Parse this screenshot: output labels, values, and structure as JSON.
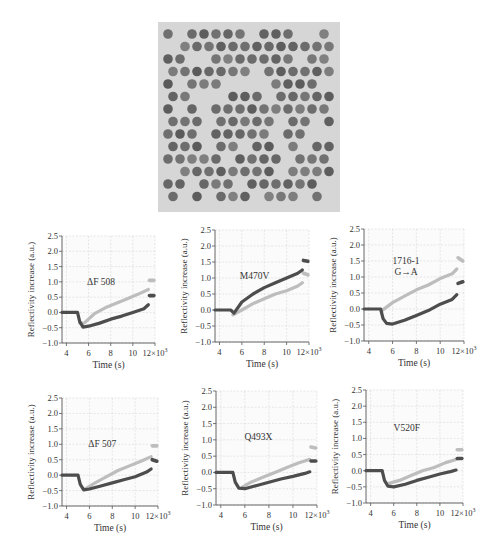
{
  "figure": {
    "image_panel": {
      "description": "microarray photograph with spotted DNA probes",
      "rows": 14,
      "cols": 14
    }
  },
  "chart_data": [
    {
      "type": "line",
      "title": "ΔF 508",
      "title_lines": [
        "ΔF 508"
      ],
      "xlabel": "Time (s)",
      "ylabel": "Reflectivity increase (a.u.)",
      "x_scale_note": "×10³",
      "xticks": [
        "4",
        "6",
        "8",
        "10",
        "12×10³"
      ],
      "yticks": [
        "2.5",
        "2.0",
        "1.5",
        "1.0",
        "0.5",
        "0.0",
        "−0.5",
        "−1.0"
      ],
      "xlim": [
        3.6,
        12.0
      ],
      "ylim": [
        -1.0,
        2.5
      ],
      "grid": true,
      "series": [
        {
          "name": "light trace",
          "color": "#bdbdbd",
          "x": [
            5.2,
            5.6,
            6.5,
            7.5,
            8.5,
            9.5,
            10.5,
            11.4,
            11.5,
            11.9
          ],
          "y": [
            -0.35,
            -0.35,
            -0.05,
            0.15,
            0.3,
            0.45,
            0.6,
            0.75,
            1.05,
            1.05
          ]
        },
        {
          "name": "dark trace",
          "color": "#4d4d4d",
          "x": [
            3.6,
            5.0,
            5.2,
            5.5,
            6.0,
            7.0,
            8.0,
            9.0,
            10.0,
            11.0,
            11.4,
            11.5,
            11.9
          ],
          "y": [
            0.0,
            0.0,
            -0.3,
            -0.48,
            -0.45,
            -0.35,
            -0.22,
            -0.12,
            0.0,
            0.12,
            0.25,
            0.55,
            0.55
          ]
        }
      ]
    },
    {
      "type": "line",
      "title": "M470V",
      "title_lines": [
        "M470V"
      ],
      "xlabel": "Time (s)",
      "ylabel": "Reflectivity increase (a.u.)",
      "xticks": [
        "4",
        "6",
        "8",
        "10",
        "12×10³"
      ],
      "yticks": [
        "2.5",
        "2.0",
        "1.5",
        "1.0",
        "0.5",
        "0.0",
        "−0.5",
        "−1.0"
      ],
      "xlim": [
        3.6,
        12.0
      ],
      "ylim": [
        -1.0,
        2.5
      ],
      "grid": true,
      "series": [
        {
          "name": "light trace",
          "color": "#bdbdbd",
          "x": [
            5.2,
            6.0,
            7.0,
            8.0,
            9.0,
            10.0,
            11.0,
            11.4,
            11.5,
            11.9
          ],
          "y": [
            -0.15,
            0.0,
            0.2,
            0.35,
            0.5,
            0.6,
            0.75,
            0.85,
            1.15,
            1.1
          ]
        },
        {
          "name": "dark trace",
          "color": "#4d4d4d",
          "x": [
            3.6,
            5.0,
            5.3,
            6.0,
            7.0,
            8.0,
            9.0,
            10.0,
            11.0,
            11.4,
            11.5,
            11.9
          ],
          "y": [
            0.0,
            0.0,
            -0.1,
            0.25,
            0.5,
            0.7,
            0.85,
            1.0,
            1.15,
            1.25,
            1.55,
            1.52
          ]
        }
      ]
    },
    {
      "type": "line",
      "title": "1716-1 G→A",
      "title_lines": [
        "1716-1",
        "G→A"
      ],
      "xlabel": "Time (s)",
      "ylabel": "Reflectivity increase (a.u.)",
      "xticks": [
        "4",
        "6",
        "8",
        "10",
        "12×10³"
      ],
      "yticks": [
        "2.5",
        "2.0",
        "1.5",
        "1.0",
        "0.5",
        "0.0",
        "−0.5",
        "−1.0"
      ],
      "xlim": [
        3.6,
        12.0
      ],
      "ylim": [
        -1.0,
        2.5
      ],
      "grid": true,
      "series": [
        {
          "name": "light trace",
          "color": "#bdbdbd",
          "x": [
            5.1,
            6.0,
            7.0,
            8.0,
            9.0,
            10.0,
            11.0,
            11.4,
            11.5,
            11.9
          ],
          "y": [
            -0.05,
            0.2,
            0.4,
            0.6,
            0.75,
            0.95,
            1.1,
            1.25,
            1.6,
            1.5
          ]
        },
        {
          "name": "dark trace",
          "color": "#4d4d4d",
          "x": [
            3.6,
            5.0,
            5.2,
            5.5,
            6.0,
            7.0,
            8.0,
            9.0,
            10.0,
            11.0,
            11.4,
            11.5,
            11.9
          ],
          "y": [
            0.0,
            0.0,
            -0.3,
            -0.45,
            -0.47,
            -0.35,
            -0.2,
            -0.05,
            0.15,
            0.3,
            0.45,
            0.8,
            0.85
          ]
        }
      ]
    },
    {
      "type": "line",
      "title": "ΔF 507",
      "title_lines": [
        "ΔF 507"
      ],
      "xlabel": "Time (s)",
      "ylabel": "Reflectivity increase (a.u.)",
      "xticks": [
        "4",
        "6",
        "8",
        "10",
        "12×10³"
      ],
      "yticks": [
        "2.5",
        "2.0",
        "1.5",
        "1.0",
        "0.5",
        "0.0",
        "−0.5",
        "−1.0"
      ],
      "xlim": [
        3.6,
        12.0
      ],
      "ylim": [
        -1.0,
        2.5
      ],
      "grid": true,
      "series": [
        {
          "name": "light trace",
          "color": "#bdbdbd",
          "x": [
            5.6,
            6.5,
            7.5,
            8.5,
            9.5,
            10.5,
            11.4,
            11.5,
            11.9
          ],
          "y": [
            -0.45,
            -0.25,
            -0.05,
            0.15,
            0.3,
            0.45,
            0.6,
            0.95,
            0.95
          ]
        },
        {
          "name": "dark trace",
          "color": "#4d4d4d",
          "x": [
            3.6,
            5.0,
            5.2,
            5.5,
            6.0,
            7.0,
            8.0,
            9.0,
            10.0,
            11.0,
            11.4,
            11.5,
            11.9
          ],
          "y": [
            0.0,
            0.0,
            -0.3,
            -0.48,
            -0.45,
            -0.35,
            -0.25,
            -0.15,
            -0.05,
            0.1,
            0.2,
            0.5,
            0.45
          ]
        }
      ]
    },
    {
      "type": "line",
      "title": "Q493X",
      "title_lines": [
        "Q493X"
      ],
      "xlabel": "Time (s)",
      "ylabel": "Reflectivity increase (a.u.)",
      "xticks": [
        "4",
        "6",
        "8",
        "10",
        "12×10³"
      ],
      "yticks": [
        "2.5",
        "2.0",
        "1.5",
        "1.0",
        "0.5",
        "0.0",
        "−0.5",
        "−1.0"
      ],
      "xlim": [
        3.6,
        12.0
      ],
      "ylim": [
        -1.0,
        2.5
      ],
      "grid": true,
      "series": [
        {
          "name": "light trace",
          "color": "#bdbdbd",
          "x": [
            5.8,
            6.5,
            7.5,
            8.5,
            9.5,
            10.5,
            11.4,
            11.5,
            11.9
          ],
          "y": [
            -0.45,
            -0.3,
            -0.15,
            0.0,
            0.15,
            0.3,
            0.4,
            0.78,
            0.75
          ]
        },
        {
          "name": "dark trace",
          "color": "#4d4d4d",
          "x": [
            3.6,
            5.0,
            5.2,
            5.5,
            6.0,
            7.0,
            8.0,
            9.0,
            10.0,
            11.0,
            11.4,
            11.5,
            11.9
          ],
          "y": [
            0.0,
            0.0,
            -0.3,
            -0.48,
            -0.5,
            -0.4,
            -0.3,
            -0.2,
            -0.12,
            -0.03,
            0.02,
            0.35,
            0.35
          ]
        }
      ]
    },
    {
      "type": "line",
      "title": "V520F",
      "title_lines": [
        "V520F"
      ],
      "xlabel": "Time (s)",
      "ylabel": "Reflectivity increase (a.u.)",
      "xticks": [
        "4",
        "6",
        "8",
        "10",
        "12×10³"
      ],
      "yticks": [
        "2.5",
        "2.0",
        "1.5",
        "1.0",
        "0.5",
        "0.0",
        "−0.5",
        "−1.0"
      ],
      "xlim": [
        3.6,
        12.0
      ],
      "ylim": [
        -1.0,
        2.5
      ],
      "grid": true,
      "series": [
        {
          "name": "light trace",
          "color": "#bdbdbd",
          "x": [
            5.5,
            6.5,
            7.5,
            8.5,
            9.5,
            10.5,
            11.4,
            11.5,
            11.9
          ],
          "y": [
            -0.4,
            -0.3,
            -0.15,
            0.0,
            0.1,
            0.25,
            0.35,
            0.65,
            0.65
          ]
        },
        {
          "name": "dark trace",
          "color": "#4d4d4d",
          "x": [
            3.6,
            5.0,
            5.2,
            5.5,
            6.0,
            7.0,
            8.0,
            9.0,
            10.0,
            11.0,
            11.4,
            11.5,
            11.9
          ],
          "y": [
            0.0,
            0.0,
            -0.3,
            -0.48,
            -0.5,
            -0.42,
            -0.3,
            -0.2,
            -0.1,
            -0.02,
            0.02,
            0.38,
            0.38
          ]
        }
      ]
    }
  ],
  "layout": {
    "panels": [
      {
        "left": 0,
        "top": 225,
        "plot_x0": 62,
        "plot_x1": 155,
        "plot_y0": 236,
        "plot_y1": 343
      },
      {
        "left": 170,
        "top": 220,
        "plot_x0": 215,
        "plot_x1": 309,
        "plot_y0": 230,
        "plot_y1": 342
      },
      {
        "left": 330,
        "top": 220,
        "plot_x0": 364,
        "plot_x1": 464,
        "plot_y0": 229,
        "plot_y1": 341
      },
      {
        "left": 0,
        "top": 380,
        "plot_x0": 62,
        "plot_x1": 158,
        "plot_y0": 398,
        "plot_y1": 506
      },
      {
        "left": 170,
        "top": 380,
        "plot_x0": 216,
        "plot_x1": 317,
        "plot_y0": 391,
        "plot_y1": 505
      },
      {
        "left": 330,
        "top": 380,
        "plot_x0": 366,
        "plot_x1": 463,
        "plot_y0": 390,
        "plot_y1": 503
      }
    ]
  }
}
